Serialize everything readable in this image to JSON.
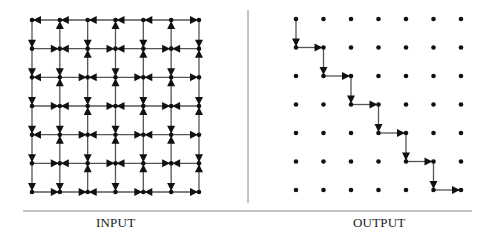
{
  "panels": {
    "input": {
      "label": "INPUT",
      "grid": {
        "cols": 7,
        "rows": 7,
        "x0": 32,
        "dx": 27.83,
        "y0": 20,
        "dy": 28.67
      },
      "arrowheads": [
        [
          [
            "L"
          ],
          [
            "U",
            "L"
          ],
          [
            "L"
          ],
          [
            "U",
            "L"
          ],
          [
            "L"
          ],
          [
            "U"
          ],
          [
            "R"
          ]
        ],
        [
          [
            "D"
          ],
          [
            "R",
            "L"
          ],
          [
            "D",
            "U"
          ],
          [
            "R",
            "L"
          ],
          [
            "D",
            "U"
          ],
          [
            "R",
            "L"
          ],
          [
            "D",
            "U"
          ]
        ],
        [
          [
            "D",
            "L"
          ],
          [
            "D",
            "U"
          ],
          [
            "R",
            "L"
          ],
          [
            "D",
            "U"
          ],
          [
            "R",
            "L"
          ],
          [
            "D",
            "U"
          ],
          [
            "R"
          ]
        ],
        [
          [
            "D"
          ],
          [
            "R",
            "L"
          ],
          [
            "D",
            "U"
          ],
          [
            "R",
            "L"
          ],
          [
            "D",
            "U"
          ],
          [
            "R",
            "L"
          ],
          [
            "D",
            "U"
          ]
        ],
        [
          [
            "D",
            "L"
          ],
          [
            "D",
            "U"
          ],
          [
            "R",
            "L"
          ],
          [
            "D",
            "U"
          ],
          [
            "R",
            "L"
          ],
          [
            "D",
            "U"
          ],
          [
            "R"
          ]
        ],
        [
          [
            "D"
          ],
          [
            "R",
            "L"
          ],
          [
            "D",
            "U"
          ],
          [
            "R",
            "L"
          ],
          [
            "D",
            "U"
          ],
          [
            "R",
            "L"
          ],
          [
            "D",
            "U"
          ]
        ],
        [
          [
            "D"
          ],
          [
            "D",
            "R"
          ],
          [
            "R",
            "L"
          ],
          [
            "D"
          ],
          [
            "R",
            "L"
          ],
          [
            "D"
          ],
          [
            "R"
          ]
        ]
      ]
    },
    "output": {
      "label": "OUTPUT",
      "grid": {
        "cols": 7,
        "rows": 7,
        "x0": 296,
        "dx": 27.5,
        "y0": 19,
        "dy": 28.5
      },
      "path": [
        [
          0,
          0
        ],
        [
          0,
          1
        ],
        [
          1,
          1
        ],
        [
          1,
          2
        ],
        [
          2,
          2
        ],
        [
          2,
          3
        ],
        [
          3,
          3
        ],
        [
          3,
          4
        ],
        [
          4,
          4
        ],
        [
          4,
          5
        ],
        [
          5,
          5
        ],
        [
          5,
          6
        ],
        [
          6,
          6
        ]
      ]
    }
  },
  "divider": {
    "x": 248,
    "y1": 10,
    "y2": 203
  },
  "rule": {
    "x1": 23,
    "x2": 472,
    "y": 211
  },
  "colors": {
    "ink": "#111111",
    "edge": "#555555",
    "rule": "#888888"
  }
}
